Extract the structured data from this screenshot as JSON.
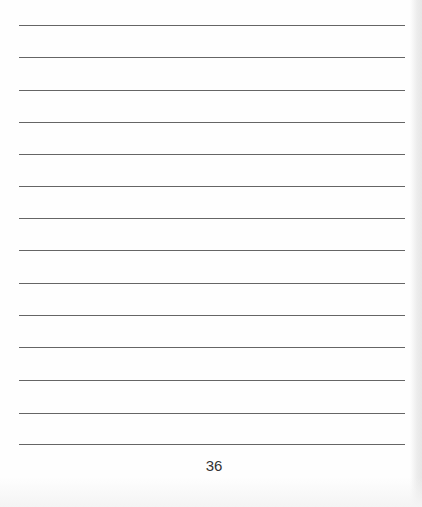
{
  "page": {
    "type": "lined-notes-page",
    "line_count": 14,
    "line_positions_y": [
      25,
      57,
      90,
      122,
      154,
      186,
      218,
      250,
      283,
      315,
      347,
      380,
      413,
      444
    ],
    "line_color": "#4a4a4a",
    "page_number": "36"
  }
}
